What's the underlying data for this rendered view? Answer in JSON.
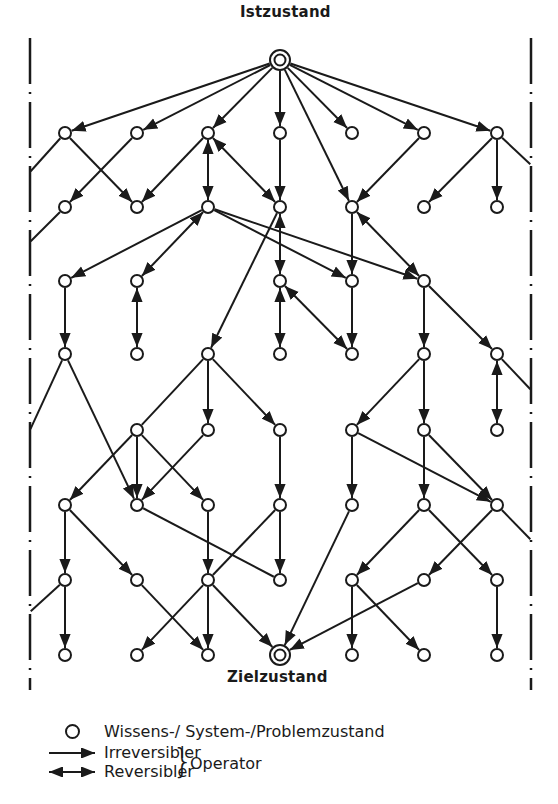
{
  "diagram": {
    "title_start": "Istzustand",
    "title_goal": "Zielzustand",
    "colors": {
      "ink": "#1a1a1a",
      "background": "#ffffff"
    },
    "start_node": {
      "id": "S",
      "x": 280,
      "y": 60
    },
    "goal_node": {
      "id": "G",
      "x": 280,
      "y": 655
    },
    "nodes": [
      {
        "id": "a1",
        "x": 65,
        "y": 133
      },
      {
        "id": "a2",
        "x": 137,
        "y": 133
      },
      {
        "id": "a3",
        "x": 208,
        "y": 133
      },
      {
        "id": "a4",
        "x": 280,
        "y": 133
      },
      {
        "id": "a5",
        "x": 352,
        "y": 133
      },
      {
        "id": "a6",
        "x": 424,
        "y": 133
      },
      {
        "id": "a7",
        "x": 497,
        "y": 133
      },
      {
        "id": "b1",
        "x": 65,
        "y": 207
      },
      {
        "id": "b2",
        "x": 137,
        "y": 207
      },
      {
        "id": "b3",
        "x": 208,
        "y": 207
      },
      {
        "id": "b4",
        "x": 280,
        "y": 207
      },
      {
        "id": "b5",
        "x": 352,
        "y": 207
      },
      {
        "id": "b6",
        "x": 424,
        "y": 207
      },
      {
        "id": "b7",
        "x": 497,
        "y": 207
      },
      {
        "id": "c1",
        "x": 65,
        "y": 281
      },
      {
        "id": "c2",
        "x": 137,
        "y": 281
      },
      {
        "id": "c4",
        "x": 280,
        "y": 281
      },
      {
        "id": "c5",
        "x": 352,
        "y": 281
      },
      {
        "id": "c6",
        "x": 424,
        "y": 281
      },
      {
        "id": "d1",
        "x": 65,
        "y": 354
      },
      {
        "id": "d2",
        "x": 137,
        "y": 354
      },
      {
        "id": "d3",
        "x": 208,
        "y": 354
      },
      {
        "id": "d4",
        "x": 280,
        "y": 354
      },
      {
        "id": "d5",
        "x": 352,
        "y": 354
      },
      {
        "id": "d6",
        "x": 424,
        "y": 354
      },
      {
        "id": "d7",
        "x": 497,
        "y": 354
      },
      {
        "id": "e2",
        "x": 137,
        "y": 430
      },
      {
        "id": "e3",
        "x": 208,
        "y": 430
      },
      {
        "id": "e4",
        "x": 280,
        "y": 430
      },
      {
        "id": "e5",
        "x": 352,
        "y": 430
      },
      {
        "id": "e6",
        "x": 424,
        "y": 430
      },
      {
        "id": "e7",
        "x": 497,
        "y": 430
      },
      {
        "id": "f1",
        "x": 65,
        "y": 505
      },
      {
        "id": "f2",
        "x": 137,
        "y": 505
      },
      {
        "id": "f3",
        "x": 208,
        "y": 505
      },
      {
        "id": "f4",
        "x": 280,
        "y": 505
      },
      {
        "id": "f5",
        "x": 352,
        "y": 505
      },
      {
        "id": "f6",
        "x": 424,
        "y": 505
      },
      {
        "id": "f7",
        "x": 497,
        "y": 505
      },
      {
        "id": "g1",
        "x": 65,
        "y": 580
      },
      {
        "id": "g2",
        "x": 137,
        "y": 580
      },
      {
        "id": "g3",
        "x": 208,
        "y": 580
      },
      {
        "id": "g4",
        "x": 280,
        "y": 580
      },
      {
        "id": "g5",
        "x": 352,
        "y": 580
      },
      {
        "id": "g6",
        "x": 424,
        "y": 580
      },
      {
        "id": "g7",
        "x": 497,
        "y": 580
      },
      {
        "id": "h1",
        "x": 65,
        "y": 655
      },
      {
        "id": "h2",
        "x": 137,
        "y": 655
      },
      {
        "id": "h3",
        "x": 208,
        "y": 655
      },
      {
        "id": "h5",
        "x": 352,
        "y": 655
      },
      {
        "id": "h6",
        "x": 424,
        "y": 655
      },
      {
        "id": "h7",
        "x": 497,
        "y": 655
      }
    ],
    "edges": [
      {
        "from": "S",
        "to": "a1",
        "type": "irreversible"
      },
      {
        "from": "S",
        "to": "a2",
        "type": "irreversible"
      },
      {
        "from": "S",
        "to": "a3",
        "type": "irreversible"
      },
      {
        "from": "S",
        "to": "a4",
        "type": "irreversible"
      },
      {
        "from": "S",
        "to": "a5",
        "type": "irreversible"
      },
      {
        "from": "S",
        "to": "a6",
        "type": "irreversible"
      },
      {
        "from": "S",
        "to": "a7",
        "type": "irreversible"
      },
      {
        "from": "S",
        "to": "b5",
        "type": "irreversible"
      },
      {
        "from": "a1",
        "to": "b2",
        "type": "irreversible"
      },
      {
        "from": "a2",
        "to": "b1",
        "type": "irreversible"
      },
      {
        "from": "a3",
        "to": "b2",
        "type": "irreversible"
      },
      {
        "from": "a3",
        "to": "b3",
        "type": "reversible"
      },
      {
        "from": "a3",
        "to": "b4",
        "type": "reversible"
      },
      {
        "from": "a4",
        "to": "b4",
        "type": "irreversible"
      },
      {
        "from": "a6",
        "to": "b5",
        "type": "irreversible"
      },
      {
        "from": "a7",
        "to": "b6",
        "type": "irreversible"
      },
      {
        "from": "a7",
        "to": "b7",
        "type": "irreversible"
      },
      {
        "from": "b3",
        "to": "c1",
        "type": "irreversible"
      },
      {
        "from": "b3",
        "to": "c2",
        "type": "reversible"
      },
      {
        "from": "b3",
        "to": "c5",
        "type": "irreversible"
      },
      {
        "from": "b3",
        "to": "c6",
        "type": "irreversible"
      },
      {
        "from": "b4",
        "to": "c4",
        "type": "reversible"
      },
      {
        "from": "b4",
        "to": "d3",
        "type": "irreversible"
      },
      {
        "from": "b5",
        "to": "c5",
        "type": "irreversible"
      },
      {
        "from": "b5",
        "to": "c6",
        "type": "reversible"
      },
      {
        "from": "c1",
        "to": "d1",
        "type": "irreversible"
      },
      {
        "from": "c2",
        "to": "d2",
        "type": "reversible"
      },
      {
        "from": "c4",
        "to": "d4",
        "type": "reversible"
      },
      {
        "from": "c4",
        "to": "d5",
        "type": "reversible"
      },
      {
        "from": "c5",
        "to": "d5",
        "type": "irreversible"
      },
      {
        "from": "c6",
        "to": "d6",
        "type": "irreversible"
      },
      {
        "from": "c6",
        "to": "d7",
        "type": "irreversible"
      },
      {
        "from": "d1",
        "to": "f2",
        "type": "irreversible"
      },
      {
        "from": "d3",
        "to": "e2",
        "type": "line"
      },
      {
        "from": "d3",
        "to": "e3",
        "type": "irreversible"
      },
      {
        "from": "d3",
        "to": "e4",
        "type": "irreversible"
      },
      {
        "from": "d6",
        "to": "e5",
        "type": "irreversible"
      },
      {
        "from": "d6",
        "to": "e6",
        "type": "irreversible"
      },
      {
        "from": "d7",
        "to": "e7",
        "type": "reversible"
      },
      {
        "from": "e2",
        "to": "f1",
        "type": "irreversible"
      },
      {
        "from": "e2",
        "to": "f2",
        "type": "irreversible"
      },
      {
        "from": "e2",
        "to": "f3",
        "type": "irreversible"
      },
      {
        "from": "e3",
        "to": "f2",
        "type": "irreversible"
      },
      {
        "from": "e4",
        "to": "f4",
        "type": "irreversible"
      },
      {
        "from": "e5",
        "to": "f5",
        "type": "irreversible"
      },
      {
        "from": "e5",
        "to": "f7",
        "type": "irreversible"
      },
      {
        "from": "e6",
        "to": "f6",
        "type": "irreversible"
      },
      {
        "from": "e6",
        "to": "f7",
        "type": "irreversible"
      },
      {
        "from": "f1",
        "to": "g1",
        "type": "irreversible"
      },
      {
        "from": "f1",
        "to": "g2",
        "type": "irreversible"
      },
      {
        "from": "f2",
        "to": "g4",
        "type": "line"
      },
      {
        "from": "f3",
        "to": "g3",
        "type": "irreversible"
      },
      {
        "from": "f4",
        "to": "g3",
        "type": "line"
      },
      {
        "from": "f4",
        "to": "g4",
        "type": "irreversible"
      },
      {
        "from": "f5",
        "to": "G",
        "type": "irreversible"
      },
      {
        "from": "f6",
        "to": "g5",
        "type": "irreversible"
      },
      {
        "from": "f6",
        "to": "g7",
        "type": "irreversible"
      },
      {
        "from": "f7",
        "to": "g6",
        "type": "irreversible"
      },
      {
        "from": "g1",
        "to": "h1",
        "type": "irreversible"
      },
      {
        "from": "g2",
        "to": "h3",
        "type": "irreversible"
      },
      {
        "from": "g3",
        "to": "h2",
        "type": "irreversible"
      },
      {
        "from": "g3",
        "to": "h3",
        "type": "irreversible"
      },
      {
        "from": "g3",
        "to": "G",
        "type": "irreversible"
      },
      {
        "from": "g5",
        "to": "h5",
        "type": "irreversible"
      },
      {
        "from": "g5",
        "to": "h6",
        "type": "irreversible"
      },
      {
        "from": "g6",
        "to": "G",
        "type": "irreversible"
      },
      {
        "from": "g7",
        "to": "h7",
        "type": "irreversible"
      }
    ],
    "boundary_stubs": [
      {
        "from": "a1",
        "x": 30,
        "y": 172
      },
      {
        "from": "b1",
        "x": 30,
        "y": 242
      },
      {
        "from": "d1",
        "x": 30,
        "y": 430
      },
      {
        "from": "g1",
        "x": 30,
        "y": 612
      },
      {
        "from": "a7",
        "x": 531,
        "y": 165
      },
      {
        "from": "d7",
        "x": 531,
        "y": 390
      },
      {
        "from": "f7",
        "x": 531,
        "y": 540
      }
    ]
  },
  "legend": {
    "state_label": "Wissens-/ System-/Problemzustand",
    "irreversible_label": "Irreversibler",
    "reversible_label": "Reversibler",
    "operator_label": "Operator"
  }
}
